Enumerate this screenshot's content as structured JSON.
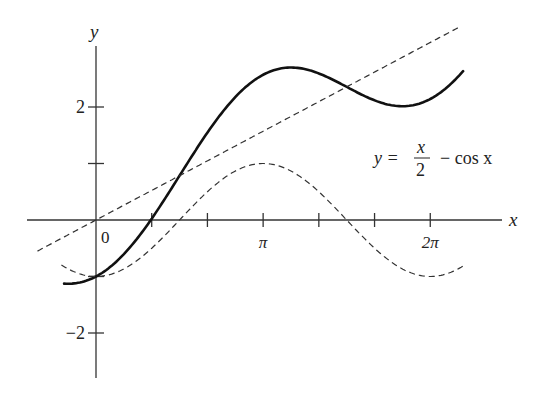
{
  "chart_data": {
    "type": "line",
    "title": "",
    "xlabel": "x",
    "ylabel": "y",
    "origin_label": "0",
    "x_ticks": [
      {
        "value": 0,
        "label": ""
      },
      {
        "value": 1.0472,
        "label": ""
      },
      {
        "value": 2.0944,
        "label": ""
      },
      {
        "value": 3.1416,
        "label": "π"
      },
      {
        "value": 4.1888,
        "label": ""
      },
      {
        "value": 5.236,
        "label": ""
      },
      {
        "value": 6.2832,
        "label": "2π"
      }
    ],
    "y_ticks": [
      {
        "value": 2,
        "label": "2"
      },
      {
        "value": 1,
        "label": ""
      },
      {
        "value": -1,
        "label": ""
      },
      {
        "value": -2,
        "label": "−2"
      }
    ],
    "xlim": [
      -1.3,
      7.6
    ],
    "ylim": [
      -2.8,
      3.1
    ],
    "grid": false,
    "annotation": {
      "lhs": "y =",
      "numerator": "x",
      "denominator": "2",
      "rhs": "− cos x"
    },
    "series": [
      {
        "name": "y = x/2 − cos x",
        "expression": "x/2 - cos(x)",
        "style": "solid",
        "x_range": [
          -0.6,
          6.9
        ],
        "points": [
          [
            -0.6,
            -1.125
          ],
          [
            0,
            -1
          ],
          [
            1.0472,
            0.024
          ],
          [
            1.5708,
            0.785
          ],
          [
            2.0944,
            1.547
          ],
          [
            2.618,
            2.175
          ],
          [
            3.1416,
            2.571
          ],
          [
            3.6652,
            2.699
          ],
          [
            4.1888,
            2.594
          ],
          [
            4.7124,
            2.356
          ],
          [
            5.236,
            2.118
          ],
          [
            5.7596,
            2.013
          ],
          [
            6.2832,
            2.142
          ],
          [
            6.9,
            2.634
          ]
        ]
      },
      {
        "name": "y = x/2",
        "expression": "x/2",
        "style": "dashed",
        "x_range": [
          -1.1,
          6.8
        ],
        "points": [
          [
            -1.1,
            -0.55
          ],
          [
            0,
            0
          ],
          [
            3.1416,
            1.571
          ],
          [
            6.2832,
            3.142
          ],
          [
            6.8,
            3.4
          ]
        ]
      },
      {
        "name": "y = −cos x",
        "expression": "-cos(x)",
        "style": "dashed",
        "x_range": [
          -0.65,
          6.9
        ],
        "points": [
          [
            -0.65,
            -0.796
          ],
          [
            0,
            -1
          ],
          [
            1.5708,
            0
          ],
          [
            3.1416,
            1
          ],
          [
            4.7124,
            0
          ],
          [
            6.2832,
            -1
          ],
          [
            6.9,
            -0.815
          ]
        ]
      }
    ]
  }
}
